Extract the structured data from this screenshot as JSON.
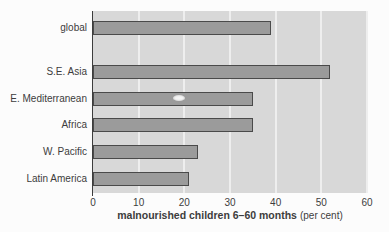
{
  "chart_data": {
    "type": "bar",
    "orientation": "horizontal",
    "title": "",
    "categories": [
      "global",
      "S.E. Asia",
      "E. Mediterranean",
      "Africa",
      "W. Pacific",
      "Latin America"
    ],
    "values": [
      39,
      52,
      35,
      35,
      23,
      21
    ],
    "xlabel": "malnourished children 6–60 months (per cent)",
    "xlabel_main": "malnourished children 6–60 months",
    "xlabel_suffix": "(per cent)",
    "ylabel": "",
    "xlim": [
      0,
      60
    ],
    "xticks": [
      0,
      10,
      20,
      30,
      40,
      50,
      60
    ],
    "grid": "vertical",
    "legend": "none",
    "colors": {
      "page_background": "#fcfcfc",
      "plot_background": "#d8d8d8",
      "bar_fill": "#9b9b9b",
      "bar_border": "#4a4a4a",
      "gridline": "#eeeeee",
      "axis_line": "#3c3c3c",
      "text": "#3d3d3d"
    }
  }
}
